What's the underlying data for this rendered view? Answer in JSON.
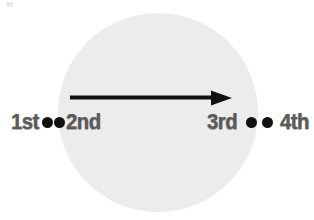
{
  "figure": {
    "type": "sequence-diagram",
    "background_color": "#ffffff",
    "disc": {
      "label": "background-circle",
      "fill_color": "#ececec",
      "center_x": 158,
      "center_y": 113,
      "radius": 100
    },
    "arrow": {
      "label": "direction-arrow",
      "color": "#111111",
      "direction": "right",
      "start_x": 72,
      "end_x": 232,
      "y": 98
    },
    "text_color": "#5b5b5b",
    "dot_color": "#111111"
  },
  "labels": {
    "left": {
      "start": "1st",
      "end": "2nd",
      "dot_count": 2
    },
    "right": {
      "start": "3rd",
      "end": "4th",
      "dot_count": 2
    }
  }
}
